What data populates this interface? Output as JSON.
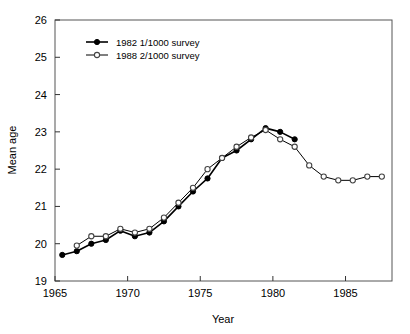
{
  "chart_data": {
    "type": "line",
    "title": "",
    "xlabel": "Year",
    "ylabel": "Mean age",
    "xlim": [
      1965,
      1988.2
    ],
    "ylim": [
      19,
      26
    ],
    "xticks": [
      1965,
      1970,
      1975,
      1980,
      1985
    ],
    "xtick_labels": [
      "1965",
      "1970",
      "1975",
      "1980",
      "1985"
    ],
    "yticks": [
      19,
      20,
      21,
      22,
      23,
      24,
      25,
      26
    ],
    "ytick_labels": [
      "19",
      "20",
      "21",
      "22",
      "23",
      "24",
      "25",
      "26"
    ],
    "grid": false,
    "legend_position": "top-left",
    "series": [
      {
        "name": "1982 1/1000 survey",
        "marker": "filled-circle",
        "color": "#000000",
        "x": [
          1965.5,
          1966.5,
          1967.5,
          1968.5,
          1969.5,
          1970.5,
          1971.5,
          1972.5,
          1973.5,
          1974.5,
          1975.5,
          1976.5,
          1977.5,
          1978.5,
          1979.5,
          1980.5,
          1981.5
        ],
        "values": [
          19.7,
          19.8,
          20.0,
          20.1,
          20.35,
          20.2,
          20.3,
          20.6,
          21.0,
          21.4,
          21.75,
          22.3,
          22.5,
          22.8,
          23.1,
          23.0,
          22.8
        ]
      },
      {
        "name": "1988 2/1000 survey",
        "marker": "open-circle",
        "color": "#000000",
        "x": [
          1966.5,
          1967.5,
          1968.5,
          1969.5,
          1970.5,
          1971.5,
          1972.5,
          1973.5,
          1974.5,
          1975.5,
          1976.5,
          1977.5,
          1978.5,
          1979.5,
          1980.5,
          1981.5,
          1982.5,
          1983.5,
          1984.5,
          1985.5,
          1986.5,
          1987.5
        ],
        "values": [
          19.95,
          20.2,
          20.2,
          20.4,
          20.3,
          20.4,
          20.7,
          21.1,
          21.5,
          22.0,
          22.3,
          22.6,
          22.85,
          23.05,
          22.8,
          22.6,
          22.1,
          21.8,
          21.7,
          21.7,
          21.8,
          21.8
        ]
      }
    ]
  },
  "legend": {
    "entries": [
      {
        "label": "1982 1/1000 survey"
      },
      {
        "label": "1988 2/1000 survey"
      }
    ]
  }
}
